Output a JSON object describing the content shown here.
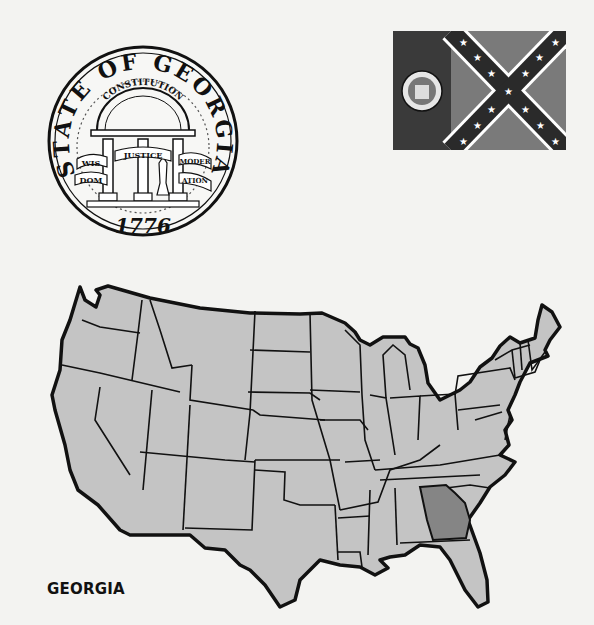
{
  "seal": {
    "title": "STATE OF GEORGIA",
    "arch_text": "CONSTITUTION",
    "banner_left_top": "WIS",
    "banner_left_bottom": "DOM",
    "banner_center": "JUSTICE",
    "banner_right_top": "MODER",
    "banner_right_bottom": "ATION",
    "year": "1776"
  },
  "flag": {
    "description": "1956 Georgia state flag",
    "hoist_color": "#3a3a3a",
    "field_color": "#7a7a7a",
    "cross_color": "#2a2a2a",
    "star_color": "#ffffff"
  },
  "map": {
    "title": "GEORGIA",
    "state_fill": "#c4c4c4",
    "highlight_fill": "#858585",
    "border_color": "#111111",
    "highlighted_state": "Georgia"
  }
}
